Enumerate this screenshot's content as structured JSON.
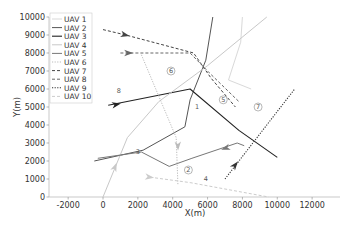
{
  "chart_data": {
    "type": "line",
    "title": "",
    "xlabel": "X(m)",
    "ylabel": "Y(m)",
    "xlim": [
      -3100,
      13600
    ],
    "ylim": [
      0,
      10000
    ],
    "xticks": [
      -2000,
      0,
      2000,
      4000,
      6000,
      8000,
      10000,
      12000
    ],
    "yticks": [
      0,
      1000,
      2000,
      3000,
      4000,
      5000,
      6000,
      7000,
      8000,
      9000,
      10000
    ],
    "grid": false,
    "legend_position": "upper left",
    "series": [
      {
        "name": "UAV 1",
        "style": "solid",
        "color": "#d9d9d9",
        "width": 1,
        "points": [
          [
            8000,
            10000
          ],
          [
            7900,
            8600
          ],
          [
            7200,
            6500
          ],
          [
            8500,
            6000
          ]
        ]
      },
      {
        "name": "UAV 2",
        "style": "solid",
        "color": "#555555",
        "width": 1,
        "points": [
          [
            6300,
            10000
          ],
          [
            5900,
            7600
          ],
          [
            5000,
            5400
          ],
          [
            4700,
            3900
          ],
          [
            2300,
            2600
          ],
          [
            -500,
            2000
          ]
        ]
      },
      {
        "name": "UAV 3",
        "style": "solid",
        "color": "#222222",
        "width": 1.1,
        "points": [
          [
            300,
            5100
          ],
          [
            5000,
            6000
          ],
          [
            7800,
            3700
          ],
          [
            10000,
            2200
          ]
        ],
        "arrow_at": [
          800,
          5150
        ]
      },
      {
        "name": "UAV 4",
        "style": "solid",
        "color": "#c8c8c8",
        "width": 1,
        "points": [
          [
            0,
            0
          ],
          [
            1400,
            3300
          ],
          [
            3200,
            5300
          ],
          [
            6000,
            7300
          ],
          [
            9400,
            10000
          ]
        ],
        "arrow_at": [
          700,
          1700
        ]
      },
      {
        "name": "UAV 5",
        "style": "solid",
        "color": "#777777",
        "width": 1,
        "points": [
          [
            -300,
            2150
          ],
          [
            2200,
            2500
          ],
          [
            3800,
            1700
          ],
          [
            5100,
            2150
          ],
          [
            7700,
            3000
          ],
          [
            8100,
            2850
          ]
        ],
        "arrow_at": [
          7000,
          2700
        ]
      },
      {
        "name": "UAV 6",
        "style": "dotted",
        "color": "#bbbbbb",
        "width": 1,
        "points": [
          [
            2200,
            7900
          ],
          [
            3200,
            5600
          ],
          [
            4200,
            3300
          ],
          [
            4300,
            700
          ]
        ],
        "arrow_at": [
          4300,
          2800
        ]
      },
      {
        "name": "UAV 7",
        "style": "dashed",
        "color": "#444444",
        "width": 1,
        "points": [
          [
            0,
            9300
          ],
          [
            1300,
            9000
          ],
          [
            5200,
            8000
          ],
          [
            6200,
            6600
          ],
          [
            7600,
            5000
          ]
        ],
        "arrow_at": [
          1300,
          9000
        ]
      },
      {
        "name": "UAV 8",
        "style": "dashed",
        "color": "#666666",
        "width": 1,
        "points": [
          [
            1000,
            8000
          ],
          [
            5000,
            8000
          ],
          [
            6100,
            6900
          ],
          [
            7800,
            5300
          ]
        ],
        "arrow_at": [
          1500,
          8000
        ]
      },
      {
        "name": "UAV 9",
        "style": "dotted",
        "color": "#333333",
        "width": 1.1,
        "points": [
          [
            7000,
            1000
          ],
          [
            9000,
            3500
          ],
          [
            11000,
            6000
          ]
        ],
        "arrow_at": [
          7600,
          1800
        ]
      },
      {
        "name": "UAV 10",
        "style": "dashed",
        "color": "#cccccc",
        "width": 1,
        "points": [
          [
            2700,
            1100
          ],
          [
            5000,
            800
          ],
          [
            9500,
            0
          ]
        ],
        "arrow_at": [
          2700,
          1100
        ]
      }
    ],
    "annotations": [
      {
        "text": "1",
        "circled": false,
        "x": 5400,
        "y": 5000
      },
      {
        "text": "2",
        "circled": true,
        "x": 4900,
        "y": 1500
      },
      {
        "text": "3",
        "circled": false,
        "x": 2000,
        "y": 2500
      },
      {
        "text": "4",
        "circled": false,
        "x": 5900,
        "y": 1000
      },
      {
        "text": "5",
        "circled": true,
        "x": 6900,
        "y": 5400
      },
      {
        "text": "6",
        "circled": true,
        "x": 3900,
        "y": 7000
      },
      {
        "text": "7",
        "circled": true,
        "x": 8900,
        "y": 5000
      },
      {
        "text": "8",
        "circled": false,
        "x": 900,
        "y": 5900
      }
    ]
  },
  "legend": {
    "items": [
      {
        "label": "UAV 1"
      },
      {
        "label": "UAV 2"
      },
      {
        "label": "UAV 3"
      },
      {
        "label": "UAV 4"
      },
      {
        "label": "UAV 5"
      },
      {
        "label": "UAV 6"
      },
      {
        "label": "UAV 7"
      },
      {
        "label": "UAV 8"
      },
      {
        "label": "UAV 9"
      },
      {
        "label": "UAV 10"
      }
    ]
  },
  "axes": {
    "xlabel": "X(m)",
    "ylabel": "Y(m)"
  }
}
